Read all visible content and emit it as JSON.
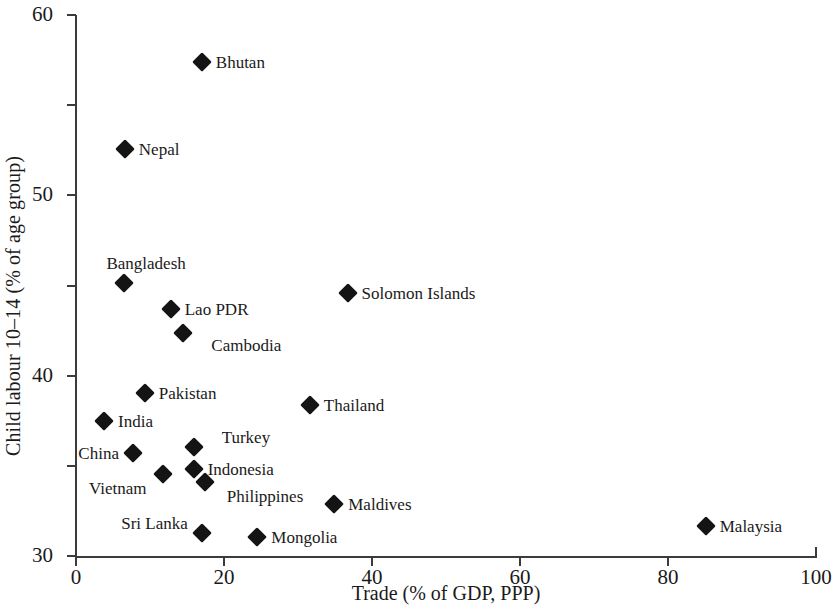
{
  "chart_data": {
    "type": "scatter",
    "title": "",
    "xlabel": "Trade (% of GDP, PPP)",
    "ylabel": "Child labour 10–14 (% of age group)",
    "xlim": [
      0,
      100
    ],
    "ylim": [
      0,
      60
    ],
    "xticks": [
      0,
      20,
      40,
      60,
      80,
      100
    ],
    "yticks": [
      0,
      10,
      20,
      30,
      40,
      50,
      60
    ],
    "xticklabels": [
      "0",
      "20",
      "40",
      "60",
      "80",
      "100"
    ],
    "yticklabels": [
      "0",
      "10",
      "20",
      "30",
      "40",
      "50",
      "60"
    ],
    "grid": false,
    "legend": "none",
    "marker": "filled-diamond",
    "marker_color": "#141414",
    "axis_color": "#3b3b3b",
    "points": [
      {
        "label": "Bhutan",
        "x": 17.0,
        "y": 54.8,
        "label_pos": "right"
      },
      {
        "label": "Nepal",
        "x": 6.6,
        "y": 45.1,
        "label_pos": "right"
      },
      {
        "label": "Bangladesh",
        "x": 6.5,
        "y": 30.3,
        "label_pos": "above"
      },
      {
        "label": "Solomon Islands",
        "x": 36.7,
        "y": 29.2,
        "label_pos": "right"
      },
      {
        "label": "Lao PDR",
        "x": 12.8,
        "y": 27.4,
        "label_pos": "right"
      },
      {
        "label": "Cambodia",
        "x": 14.5,
        "y": 24.7,
        "label_pos": "right"
      },
      {
        "label": "Pakistan",
        "x": 9.3,
        "y": 18.1,
        "label_pos": "right"
      },
      {
        "label": "Thailand",
        "x": 31.6,
        "y": 16.7,
        "label_pos": "right"
      },
      {
        "label": "India",
        "x": 3.8,
        "y": 15.0,
        "label_pos": "right"
      },
      {
        "label": "Turkey",
        "x": 15.9,
        "y": 12.1,
        "label_pos": "right"
      },
      {
        "label": "China",
        "x": 7.7,
        "y": 11.4,
        "label_pos": "left"
      },
      {
        "label": "Indonesia",
        "x": 15.9,
        "y": 9.6,
        "label_pos": "right"
      },
      {
        "label": "Vietnam",
        "x": 11.7,
        "y": 9.1,
        "label_pos": "left"
      },
      {
        "label": "Philippines",
        "x": 17.4,
        "y": 8.2,
        "label_pos": "right"
      },
      {
        "label": "Maldives",
        "x": 34.9,
        "y": 5.8,
        "label_pos": "right"
      },
      {
        "label": "Sri Lanka",
        "x": 17.0,
        "y": 2.5,
        "label_pos": "left"
      },
      {
        "label": "Mongolia",
        "x": 24.5,
        "y": 2.1,
        "label_pos": "right"
      },
      {
        "label": "Malaysia",
        "x": 85.1,
        "y": 3.3,
        "label_pos": "right"
      }
    ],
    "label_offsets": {
      "Bangladesh": {
        "dx": 22,
        "dy": -20
      },
      "Cambodia": {
        "dx": 14,
        "dy": 12
      },
      "Vietnam": {
        "dx": -2,
        "dy": 14
      },
      "Philippines": {
        "dx": 8,
        "dy": 14
      },
      "Turkey": {
        "dx": 14,
        "dy": -10
      },
      "Sri Lanka": {
        "dx": 0,
        "dy": -10
      }
    }
  }
}
